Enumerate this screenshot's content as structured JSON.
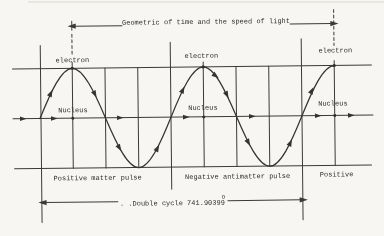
{
  "figure": {
    "title": "Geometric of time and the speed of light",
    "electron_labels": [
      "electron",
      "electron",
      "electron"
    ],
    "nucleus_labels": [
      "Nucleus",
      "Nucleus",
      "Nucleus"
    ],
    "region_labels": {
      "left": "Positive matter pulse",
      "middle": "Negative antimatter pulse",
      "right": "Positive"
    },
    "double_cycle": {
      "full": ". .Double cycle 741.90399",
      "value_degrees": "741.90399",
      "sup": "O"
    },
    "colors": {
      "ink": "#3a3a3a",
      "paper": "#f7f6f2"
    }
  }
}
